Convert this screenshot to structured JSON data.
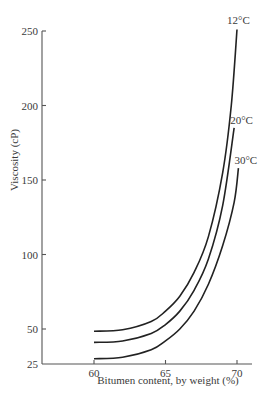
{
  "chart_data": {
    "type": "line",
    "title": "",
    "xlabel": "Bitumen content, by weight (%)",
    "ylabel": "Viscosity (cP)",
    "xlim": [
      56.6,
      71.1
    ],
    "ylim": [
      25,
      250
    ],
    "x_ticks": [
      60,
      65,
      70
    ],
    "y_ticks": [
      25,
      50,
      100,
      150,
      200,
      250
    ],
    "grid": false,
    "legend": "inline labels at curve ends",
    "series": [
      {
        "name": "12°C",
        "x": [
          60,
          62,
          64,
          65,
          66,
          67,
          68,
          69,
          69.6,
          70
        ],
        "y": [
          48.5,
          49.5,
          55,
          62,
          72,
          88,
          112,
          155,
          200,
          251
        ]
      },
      {
        "name": "20°C",
        "x": [
          60,
          62,
          64,
          65,
          66,
          67,
          68,
          69,
          69.8
        ],
        "y": [
          41,
          42,
          47,
          53,
          62,
          76,
          97,
          133,
          185
        ]
      },
      {
        "name": "30°C",
        "x": [
          60,
          62,
          64,
          65,
          66,
          67,
          68,
          69,
          69.8,
          70.1
        ],
        "y": [
          30,
          31,
          36,
          42,
          50,
          62,
          80,
          106,
          135,
          158
        ]
      }
    ]
  },
  "labels": {
    "xlabel": "Bitumen content, by weight (%)",
    "ylabel": "Viscosity (cP)"
  }
}
